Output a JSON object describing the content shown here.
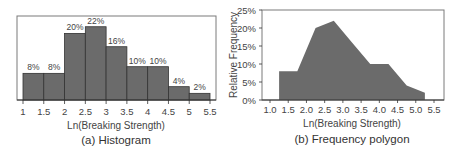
{
  "colors": {
    "fill": "#6b6b6b",
    "frame": "#7a7a7a",
    "bar_edge": "#333333"
  },
  "chart_data": [
    {
      "type": "bar",
      "title": "(a) Histogram",
      "xlabel": "Ln(Breaking Strength)",
      "ylabel": "",
      "bin_edges": [
        1,
        1.5,
        2,
        2.5,
        3,
        3.5,
        4,
        4.5,
        5,
        5.5
      ],
      "categories": [
        "1-1.5",
        "1.5-2",
        "2-2.5",
        "2.5-3",
        "3-3.5",
        "3.5-4",
        "4-4.5",
        "4.5-5",
        "5-5.5"
      ],
      "values": [
        8,
        8,
        20,
        22,
        16,
        10,
        10,
        4,
        2
      ],
      "value_labels": [
        "8%",
        "8%",
        "20%",
        "22%",
        "16%",
        "10%",
        "10%",
        "4%",
        "2%"
      ],
      "x_ticks": [
        "1",
        "1.5",
        "2",
        "2.5",
        "3",
        "3.5",
        "4",
        "4.5",
        "5",
        "5.5"
      ],
      "ylim": [
        0,
        25
      ],
      "grid": false
    },
    {
      "type": "area",
      "title": "(b) Frequency polygon",
      "xlabel": "Ln(Breaking Strength)",
      "ylabel": "Relative Frequency",
      "x": [
        1.25,
        1.75,
        2.25,
        2.75,
        3.25,
        3.75,
        4.25,
        4.75,
        5.25
      ],
      "values": [
        8,
        8,
        20,
        22,
        16,
        10,
        10,
        4,
        2
      ],
      "x_ticks": [
        "1.0",
        "1.5",
        "2.0",
        "2.5",
        "3.0",
        "3.5",
        "4.0",
        "4.5",
        "5.0",
        "5.5"
      ],
      "y_ticks": [
        "0%",
        "5%",
        "10%",
        "15%",
        "20%",
        "25%"
      ],
      "xlim": [
        1.0,
        5.5
      ],
      "ylim": [
        0,
        25
      ],
      "grid": false
    }
  ]
}
